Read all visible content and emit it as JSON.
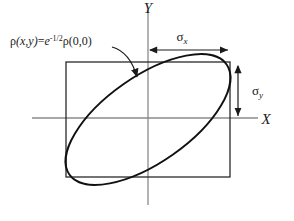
{
  "figure": {
    "background_color": "#ffffff",
    "ink_color": "#1a1a1a",
    "thin_line_color": "#808080"
  },
  "axes": {
    "x_label": "X",
    "y_label": "Y",
    "origin": {
      "x": 148,
      "y": 118
    },
    "x_axis": {
      "x1": 32,
      "x2": 258,
      "y": 118
    },
    "y_axis": {
      "y1": 10,
      "y2": 205,
      "x": 148
    }
  },
  "annotations": {
    "contour_equation": {
      "rho_1": "ρ",
      "args_1": "(x,y)",
      "equals": "=",
      "e": "e",
      "exponent": "-1/2",
      "rho_2": "ρ",
      "args_2": "(0,0)",
      "full_text": "ρ(x,y)=e-1/2ρ(0,0)"
    },
    "sigma_x": {
      "symbol": "σ",
      "subscript": "x",
      "full_text": "σx",
      "arrow_from_x": 148,
      "arrow_to_x": 230,
      "arrow_y": 50
    },
    "sigma_y": {
      "symbol": "σ",
      "subscript": "y",
      "full_text": "σy",
      "arrow_from_y": 64,
      "arrow_to_y": 118,
      "arrow_x": 238
    }
  },
  "shapes": {
    "bounding_box": {
      "left": 66,
      "top": 62,
      "right": 230,
      "bottom": 177,
      "width": 164,
      "height": 115
    },
    "ellipse": {
      "center_x": 148,
      "center_y": 119.5,
      "semi_major": 96,
      "semi_minor": 43,
      "rotation_deg": -35
    },
    "pointer_arrow": {
      "from_x": 112,
      "from_y": 48,
      "to_x": 138,
      "to_y": 82
    }
  }
}
